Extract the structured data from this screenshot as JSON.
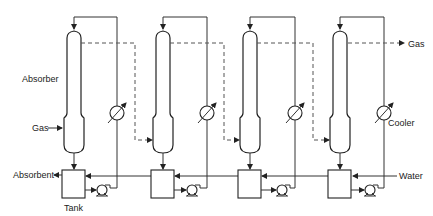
{
  "labels": {
    "absorber": "Absorber",
    "gas_in": "Gas",
    "gas_out": "Gas",
    "absorbent": "Absorbent",
    "tank": "Tank",
    "water": "Water",
    "cooler": "Cooler"
  },
  "stages": [
    {
      "id": 1,
      "col_x": 74,
      "cooler_x": 117,
      "pump_x": 102,
      "dash_x": 135
    },
    {
      "id": 2,
      "col_x": 163,
      "cooler_x": 207,
      "pump_x": 192,
      "dash_x": 224
    },
    {
      "id": 3,
      "col_x": 250,
      "cooler_x": 295,
      "pump_x": 282,
      "dash_x": 313
    },
    {
      "id": 4,
      "col_x": 340,
      "cooler_x": 384,
      "pump_x": 370,
      "dash_x": null
    }
  ],
  "colors": {
    "line": "#333333",
    "dash": "#555555",
    "background": "#ffffff"
  }
}
